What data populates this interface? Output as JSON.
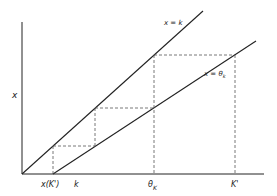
{
  "diagram": {
    "y_axis_label": "x",
    "lines": [
      {
        "name": "identity",
        "label_main": "x = k",
        "label_sub": ""
      },
      {
        "name": "theta",
        "label_main": "x = θ",
        "label_sub": "k"
      }
    ],
    "x_ticks": [
      {
        "id": "xk",
        "main": "x(K')",
        "sub": ""
      },
      {
        "id": "k",
        "main": "k",
        "sub": ""
      },
      {
        "id": "theta",
        "main": "θ",
        "sub": "K"
      },
      {
        "id": "K",
        "main": "K'",
        "sub": ""
      }
    ],
    "colors": {
      "line": "#222222",
      "dashed": "#555555"
    }
  }
}
